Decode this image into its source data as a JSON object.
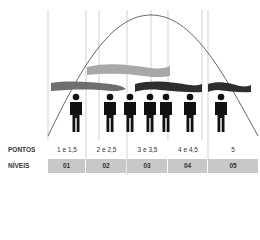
{
  "diagram": {
    "type": "bell-curve-distribution",
    "colors": {
      "curve": "#555555",
      "gridline": "#bbbbbb",
      "banner_light": "#a8a8a8",
      "banner_medium": "#6e6e6e",
      "banner_dark": "#2e2e2e",
      "figure": "#111111",
      "level_bg": "#c8c8c8"
    },
    "figure_count": 7
  },
  "rows": {
    "pontos_label": "PONTOS",
    "niveis_label": "NÍVEIS"
  },
  "columns": [
    {
      "pontos": "1 e 1,5",
      "nivel": "01"
    },
    {
      "pontos": "2 e 2,5",
      "nivel": "02"
    },
    {
      "pontos": "3 e 3,5",
      "nivel": "03"
    },
    {
      "pontos": "4 e 4,5",
      "nivel": "04"
    },
    {
      "pontos": "5",
      "nivel": "05"
    }
  ]
}
